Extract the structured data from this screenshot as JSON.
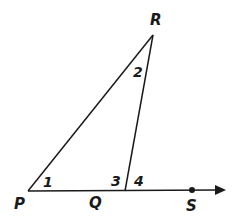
{
  "diagram": {
    "type": "triangle with exterior angle",
    "points": {
      "P": {
        "label": "P",
        "x": 28,
        "y": 191
      },
      "Q": {
        "label": "Q",
        "x": 125,
        "y": 191
      },
      "R": {
        "label": "R",
        "x": 153,
        "y": 35
      },
      "S": {
        "label": "S",
        "x": 192,
        "y": 190
      }
    },
    "angles": [
      {
        "label": "1",
        "at": "P"
      },
      {
        "label": "2",
        "at": "R"
      },
      {
        "label": "3",
        "at": "Q",
        "side": "interior"
      },
      {
        "label": "4",
        "at": "Q",
        "side": "exterior"
      }
    ],
    "segments": [
      "PR",
      "RQ",
      "PQ"
    ],
    "ray": "PS",
    "colors": {
      "stroke": "#1a1a1a",
      "background": "#ffffff"
    }
  }
}
